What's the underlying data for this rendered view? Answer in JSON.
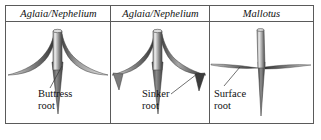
{
  "figure": {
    "kind": "root-architecture-comparison-table",
    "border_color": "#5a5a5a",
    "background": "#ffffff",
    "text_color": "#111111"
  },
  "table": {
    "columns": [
      {
        "header": "Aglaia/Nephelium",
        "label": "Buttress\nroot",
        "label_line1": "Buttress",
        "label_line2": "root",
        "root_type": "buttress",
        "description": "Tapered trunk with broad concave buttress flares and a deep taproot"
      },
      {
        "header": "Aglaia/Nephelium",
        "label": "Sinker\nroot",
        "label_line1": "Sinker",
        "label_line2": "root",
        "root_type": "sinker",
        "description": "Buttress flares with downward sinker roots descending at the outer edges"
      },
      {
        "header": "Mallotus",
        "label": "Surface\nroot",
        "label_line1": "Surface",
        "label_line2": "root",
        "root_type": "surface",
        "description": "Slender trunk with long thin lateral surface roots and a deep taproot"
      }
    ]
  }
}
